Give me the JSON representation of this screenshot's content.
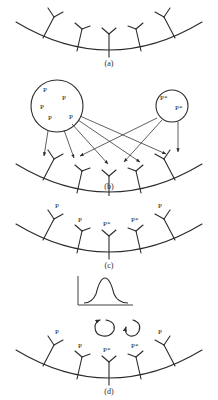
{
  "figure": {
    "background_color": "#ffffff",
    "ink_color": "#2b2b2b",
    "panels": [
      {
        "id": "a",
        "label": "(a)",
        "description": "Curved membrane with five unbound Y-shaped receptors",
        "receptor_labels": [
          "",
          "",
          "",
          "",
          ""
        ]
      },
      {
        "id": "b",
        "label": "(b)",
        "description": "Two vesicles of ligands projecting arrows onto the membrane receptors",
        "left_vesicle": {
          "molecules": [
            "P",
            "P",
            "P",
            "P",
            "P"
          ]
        },
        "right_vesicle": {
          "molecules": [
            "P*",
            "P*"
          ]
        },
        "receptor_labels": [
          "",
          "",
          "",
          "",
          ""
        ]
      },
      {
        "id": "c",
        "label": "(c)",
        "description": "Membrane receptors bound with ligands P and P*",
        "receptor_labels": [
          "P",
          "P",
          "P*",
          "P*",
          "P"
        ]
      },
      {
        "id": "d",
        "label": "(d)",
        "description": "Activated P* receptors emitting signal, with absorption spectrum inset",
        "receptor_labels": [
          "P",
          "P",
          "P*",
          "P*",
          "P"
        ],
        "emission_symbols": [
          "curved-arrow",
          "curved-arrow"
        ]
      }
    ],
    "spectrum_inset": {
      "lambda_symbol": "λ",
      "subscript": "max",
      "equals_value": "=560nm",
      "full_text": "λmax=560nm",
      "curve_type": "absorption-peak"
    }
  }
}
